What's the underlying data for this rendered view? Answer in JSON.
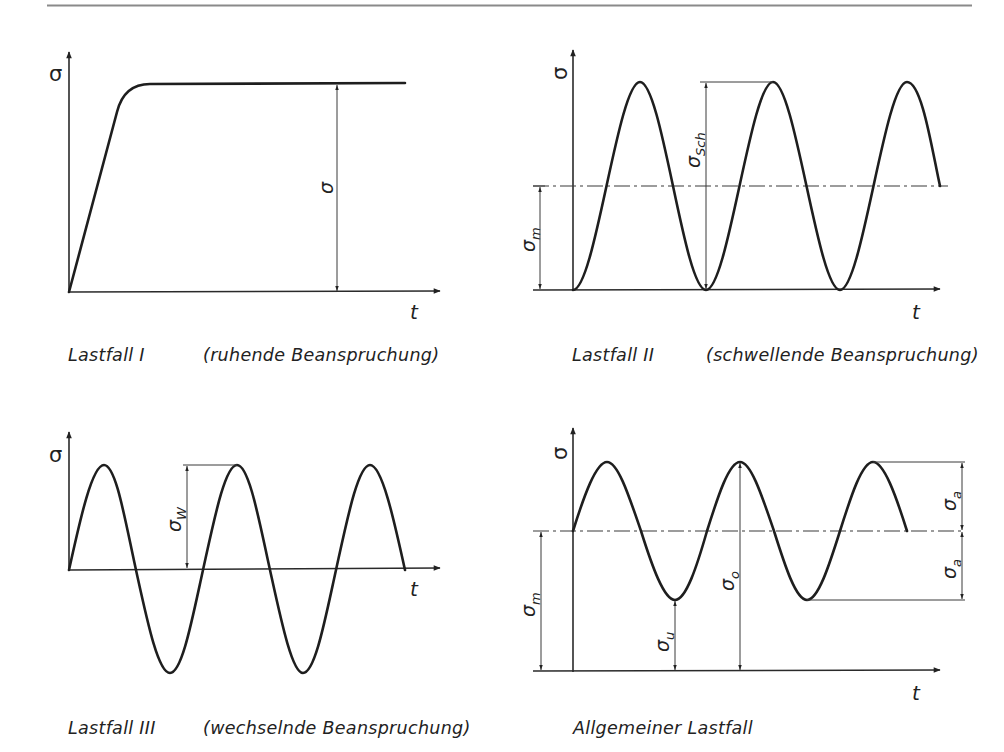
{
  "figure": {
    "panels": [
      {
        "id": "lastfall-1",
        "axis_y_label": "σ",
        "axis_x_label": "t",
        "dimension_labels": [
          {
            "symbol": "σ",
            "subscript": ""
          }
        ],
        "caption_case": "Lastfall I",
        "caption_desc": "(ruhende Beanspruchung)",
        "waveform": "ramp-then-constant"
      },
      {
        "id": "lastfall-2",
        "axis_y_label": "σ",
        "axis_x_label": "t",
        "dimension_labels": [
          {
            "symbol": "σ",
            "subscript": "Sch"
          },
          {
            "symbol": "σ",
            "subscript": "m"
          }
        ],
        "caption_case": "Lastfall II",
        "caption_desc": "(schwellende Beanspruchung)",
        "waveform": "pulsating (min = 0)"
      },
      {
        "id": "lastfall-3",
        "axis_y_label": "σ",
        "axis_x_label": "t",
        "dimension_labels": [
          {
            "symbol": "σ",
            "subscript": "W"
          }
        ],
        "caption_case": "Lastfall III",
        "caption_desc": "(wechselnde Beanspruchung)",
        "waveform": "alternating (mean = 0)"
      },
      {
        "id": "allgemeiner-lastfall",
        "axis_y_label": "σ",
        "axis_x_label": "t",
        "dimension_labels": [
          {
            "symbol": "σ",
            "subscript": "m"
          },
          {
            "symbol": "σ",
            "subscript": "u"
          },
          {
            "symbol": "σ",
            "subscript": "o"
          },
          {
            "symbol": "σ",
            "subscript": "a"
          },
          {
            "symbol": "σ",
            "subscript": "a"
          }
        ],
        "caption_case": "Allgemeiner Lastfall",
        "caption_desc": "",
        "waveform": "general (mean > 0, amplitude σa)"
      }
    ]
  }
}
